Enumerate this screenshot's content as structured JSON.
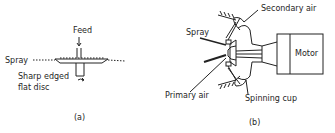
{
  "figure_a": {
    "caption": "(a)",
    "labels": {
      "feed": "Feed",
      "spray": "Spray",
      "disc_line1": "Sharp edged",
      "disc_line2": "flat disc"
    }
  },
  "figure_b": {
    "caption": "(b)",
    "labels": {
      "secondary_air": "Secondary air",
      "spray": "Spray",
      "motor": "Motor",
      "primary_air": "Primary air",
      "spinning_cup": "Spinning cup"
    }
  },
  "colors": {
    "ink": "#1e1e1e",
    "background": "#ffffff"
  }
}
